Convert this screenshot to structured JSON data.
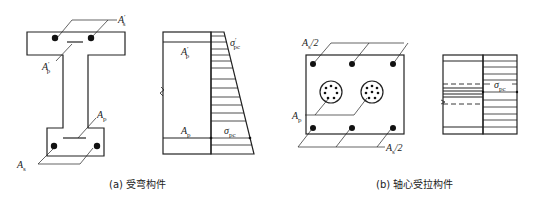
{
  "figure_a": {
    "caption": "(a) 受弯构件",
    "section_labels": {
      "As_prime": "A",
      "As_prime_sub": "s",
      "As_prime_mark": "′",
      "Ap_prime": "A",
      "Ap_prime_sub": "p",
      "Ap_prime_mark": "′",
      "Ap": "A",
      "Ap_sub": "p",
      "As": "A",
      "As_sub": "s"
    },
    "stress_labels": {
      "Ap_prime": "A",
      "Ap_prime_sub": "p",
      "Ap_prime_mark": "′",
      "Ap": "A",
      "Ap_sub": "p",
      "sigma_pc_prime": "σ",
      "sigma_pc_prime_sub": "pc",
      "sigma_pc_prime_mark": "′",
      "sigma_pc": "σ",
      "sigma_pc_sub": "pc"
    }
  },
  "figure_b": {
    "caption": "(b) 轴心受拉构件",
    "section_labels": {
      "As_half_top": "A",
      "As_half_top_sub": "s",
      "As_half_top_suffix": "/2",
      "Ap": "A",
      "Ap_sub": "p",
      "As_half_bottom": "A",
      "As_half_bottom_sub": "s",
      "As_half_bottom_suffix": "/2"
    },
    "stress_labels": {
      "sigma_pc": "σ",
      "sigma_pc_sub": "pc"
    }
  },
  "colors": {
    "line": "#222222",
    "background": "#ffffff"
  }
}
